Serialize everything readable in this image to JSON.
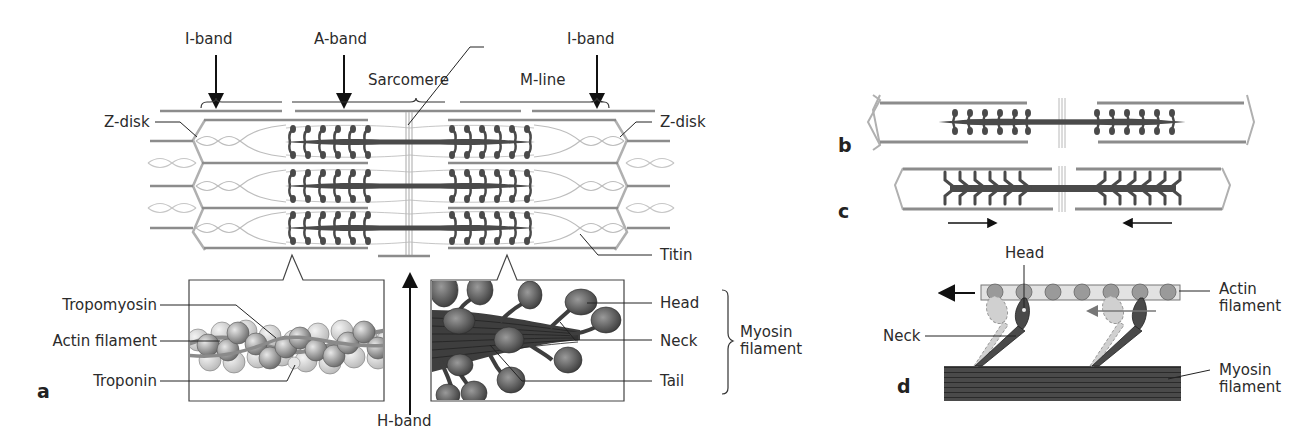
{
  "figure": {
    "panels": [
      {
        "id": "a",
        "letter": "a",
        "labels": {
          "i_band_left": "I-band",
          "a_band": "A-band",
          "i_band_right": "I-band",
          "sarcomere": "Sarcomere",
          "m_line": "M-line",
          "z_disk_left": "Z-disk",
          "z_disk_right": "Z-disk",
          "titin": "Titin",
          "h_band": "H-band",
          "tropomyosin": "Tropomyosin",
          "actin_filament": "Actin filament",
          "troponin": "Troponin",
          "head": "Head",
          "neck": "Neck",
          "tail": "Tail",
          "myosin_filament": "Myosin filament"
        }
      },
      {
        "id": "b",
        "letter": "b",
        "state": "relaxed"
      },
      {
        "id": "c",
        "letter": "c",
        "state": "contracted",
        "arrows": [
          "right",
          "left"
        ]
      },
      {
        "id": "d",
        "letter": "d",
        "labels": {
          "head": "Head",
          "neck": "Neck",
          "actin_filament": "Actin filament",
          "myosin_filament": "Myosin filament"
        }
      }
    ],
    "colors": {
      "thick_filament": "#4a4a4a",
      "thin_filament": "#8c8c8c",
      "z_disk": "#b0b0b0",
      "titin": "#bdbdbd",
      "actin_bead": "#9a9a9a",
      "actin_bg": "#e2e2e2",
      "text": "#2b2b2b"
    }
  }
}
